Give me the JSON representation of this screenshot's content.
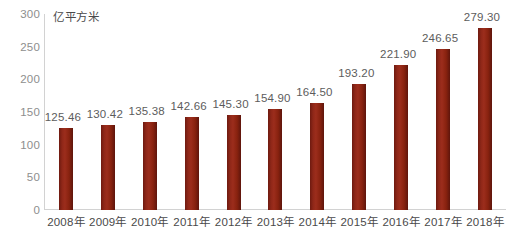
{
  "chart_data": {
    "type": "bar",
    "title": "",
    "subtitle": "",
    "xlabel": "",
    "ylabel": "",
    "unit_label": "亿平方米",
    "categories": [
      "2008年",
      "2009年",
      "2010年",
      "2011年",
      "2012年",
      "2013年",
      "2014年",
      "2015年",
      "2016年",
      "2017年",
      "2018年"
    ],
    "values": [
      125.46,
      130.42,
      135.38,
      142.66,
      145.3,
      154.9,
      164.5,
      193.2,
      221.9,
      246.65,
      279.3
    ],
    "value_labels": [
      "125.46",
      "130.42",
      "135.38",
      "142.66",
      "145.30",
      "154.90",
      "164.50",
      "193.20",
      "221.90",
      "246.65",
      "279.30"
    ],
    "ylim": [
      0,
      300
    ],
    "ytick_values": [
      0,
      50,
      100,
      150,
      200,
      250,
      300
    ],
    "ytick_labels": [
      "0",
      "50",
      "100",
      "150",
      "200",
      "250",
      "300"
    ],
    "grid": false,
    "legend": null,
    "legend_position": "none",
    "series": [
      {
        "name": "",
        "values": [
          125.46,
          130.42,
          135.38,
          142.66,
          145.3,
          154.9,
          164.5,
          193.2,
          221.9,
          246.65,
          279.3
        ],
        "color": "#8f2718"
      }
    ],
    "colors": {
      "bar": "#8f2718",
      "bar_dark": "#5e150c",
      "bar_light": "#9c2d1c",
      "axis": "#d2d2d2",
      "tick_text": "#8e8e8e",
      "label_text": "#4a4a4a",
      "value_text": "#5c5c5c",
      "background": "#ffffff"
    }
  }
}
